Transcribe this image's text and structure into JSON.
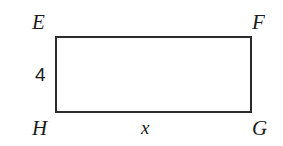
{
  "figure": {
    "type": "geometry-diagram",
    "shape": "rectangle",
    "name": "EFGH",
    "background_color": "#ffffff",
    "stroke_color": "#2b2b2b",
    "text_color": "#1b1b1b",
    "stroke_width_px": 2,
    "canvas": {
      "width": 283,
      "height": 146
    },
    "bounds": {
      "x": 55,
      "y": 36,
      "width": 197,
      "height": 77
    },
    "vertices": [
      {
        "key": "e",
        "label": "E",
        "position": "top-left"
      },
      {
        "key": "f",
        "label": "F",
        "position": "top-right"
      },
      {
        "key": "g",
        "label": "G",
        "position": "bottom-right"
      },
      {
        "key": "h",
        "label": "H",
        "position": "bottom-left"
      }
    ],
    "measures": [
      {
        "key": "height",
        "label": "4",
        "side": "left",
        "edge": "EH",
        "style": "upright"
      },
      {
        "key": "width",
        "label": "x",
        "side": "bottom",
        "edge": "HG",
        "style": "italic"
      }
    ]
  }
}
